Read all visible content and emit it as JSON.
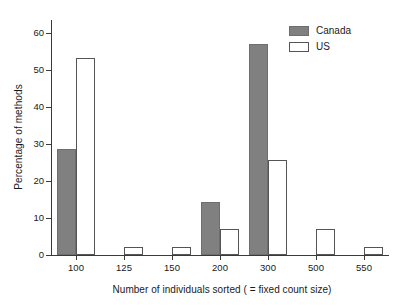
{
  "chart_data": {
    "type": "bar",
    "title": "",
    "xlabel": "Number of individuals sorted ( = fixed count size)",
    "ylabel": "Percentage of methods",
    "categories": [
      "100",
      "125",
      "150",
      "200",
      "300",
      "500",
      "550"
    ],
    "series": [
      {
        "name": "Canada",
        "color": "#808080",
        "values": [
          28.6,
          0,
          0,
          14.3,
          57.1,
          0,
          0
        ]
      },
      {
        "name": "US",
        "color": "#ffffff",
        "values": [
          53.4,
          2.2,
          2.2,
          6.9,
          25.6,
          6.9,
          2.2
        ]
      }
    ],
    "ylim": [
      0,
      63
    ],
    "yticks": [
      0,
      10,
      20,
      30,
      40,
      50,
      60
    ],
    "ytick_labels": [
      "0",
      "10",
      "20",
      "30",
      "40",
      "50",
      "60"
    ],
    "grid": false,
    "legend_position": "top-right"
  },
  "legend": {
    "entries": [
      {
        "label": "Canada",
        "style": "filled-gray"
      },
      {
        "label": "US",
        "style": "outline-white"
      }
    ]
  }
}
